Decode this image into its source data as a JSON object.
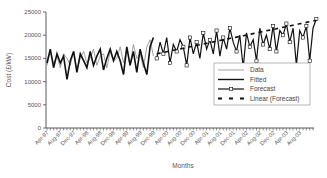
{
  "chart_data": {
    "type": "line",
    "title": "",
    "xlabel": "Months",
    "ylabel": "Cost (£/kW)",
    "ylim": [
      0,
      25000
    ],
    "yticks": [
      0,
      5000,
      10000,
      15000,
      20000,
      25000
    ],
    "xtick_labels": [
      "Apr-97",
      "Aug-97",
      "Dec-97",
      "Apr-98",
      "Aug-98",
      "Dec-98",
      "Apr-99",
      "Aug-99",
      "Dec-99",
      "Apr-00",
      "Aug-00",
      "Dec-00",
      "Apr-01",
      "Aug-01",
      "Dec-01",
      "Apr-02",
      "Aug-02",
      "Dec-02",
      "Apr-03",
      "Aug-03"
    ],
    "x_start": "Apr-97",
    "n_months": 81,
    "forecast_start_index": 33,
    "grid": false,
    "legend_position": "lower right inside",
    "legend": [
      "Data",
      "Fitted",
      "Forecast",
      "Linear (Forecast)"
    ],
    "series": [
      {
        "name": "Data",
        "style": "thin gray line",
        "values": [
          13500,
          16500,
          14000,
          15500,
          13000,
          16000,
          15000,
          13500,
          16500,
          12500,
          15000,
          16500,
          14000,
          15000,
          17000,
          13500,
          15500,
          16000,
          13000,
          16500,
          14500,
          15000,
          17500,
          14000,
          17000,
          13500,
          18000,
          15000,
          16000,
          13000,
          17500,
          19000,
          15500
        ]
      },
      {
        "name": "Fitted",
        "style": "thick black line",
        "values": [
          14000,
          17000,
          13000,
          16000,
          14000,
          15500,
          10500,
          14500,
          16500,
          12000,
          16000,
          14500,
          13000,
          16500,
          13500,
          15500,
          17000,
          12500,
          15000,
          17000,
          14500,
          16500,
          14500,
          11500,
          17500,
          13500,
          16500,
          12000,
          17000,
          14000,
          11500,
          17500,
          19500
        ]
      },
      {
        "name": "Forecast",
        "style": "black line with square markers",
        "values": [
          15000,
          18500,
          16000,
          19500,
          14000,
          18000,
          16500,
          19000,
          17500,
          13500,
          19500,
          16000,
          18500,
          15000,
          20500,
          17000,
          19000,
          16000,
          21000,
          15500,
          19500,
          17000,
          21500,
          18500,
          16500,
          20000,
          13000,
          20500,
          17500,
          19000,
          14500,
          21500,
          18000,
          20000,
          17000,
          22000,
          16500,
          21000,
          20000,
          22500,
          18500,
          21500,
          13500,
          21000,
          19500,
          22000,
          14500,
          21500,
          23500
        ]
      },
      {
        "name": "Linear (Forecast)",
        "style": "thick black dashed line",
        "values": [
          16000,
          16150,
          16300,
          16450,
          16600,
          16750,
          16900,
          17050,
          17200,
          17350,
          17500,
          17650,
          17800,
          17950,
          18100,
          18250,
          18400,
          18550,
          18700,
          18850,
          19000,
          19150,
          19300,
          19450,
          19600,
          19750,
          19900,
          20050,
          20200,
          20350,
          20500,
          20650,
          20800,
          20950,
          21100,
          21250,
          21400,
          21550,
          21700,
          21850,
          22000,
          22150,
          22300,
          22450,
          22600,
          22750,
          22900,
          23050,
          23200
        ]
      }
    ]
  }
}
